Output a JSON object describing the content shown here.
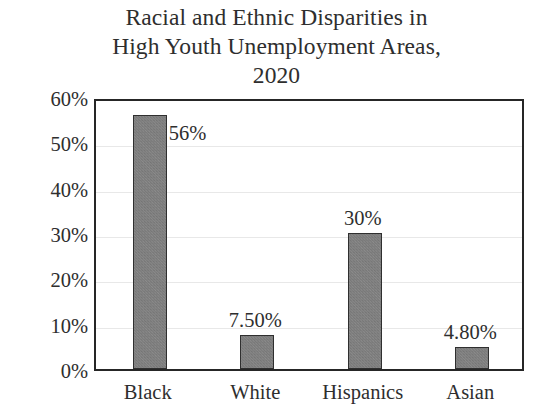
{
  "chart_data": {
    "type": "bar",
    "title": "Racial and Ethnic Disparities in High Youth Unemployment Areas, 2020",
    "title_lines": [
      "Racial and Ethnic Disparities in",
      "High Youth Unemployment Areas,",
      "2020"
    ],
    "xlabel": "",
    "ylabel": "",
    "categories": [
      "Black",
      "White",
      "Hispanics",
      "Asian"
    ],
    "values": [
      56,
      7.5,
      30,
      4.8
    ],
    "data_labels": [
      "56%",
      "7.50%",
      "30%",
      "4.80%"
    ],
    "ylim": [
      0,
      60
    ],
    "ytick_values": [
      0,
      10,
      20,
      30,
      40,
      50,
      60
    ],
    "ytick_labels": [
      "0%",
      "10%",
      "20%",
      "30%",
      "40%",
      "50%",
      "60%"
    ],
    "grid": true,
    "legend": "none",
    "bar_color": "#808080",
    "bar_edge_color": "#2f2f2f",
    "axis_color": "#262626",
    "grid_color": "#e8e8e8",
    "text_color": "#2e2e2e",
    "background_color": "#ffffff"
  }
}
